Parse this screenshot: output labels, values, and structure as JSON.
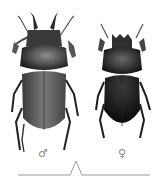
{
  "figure": {
    "specimens": [
      {
        "id": "male",
        "label": "♂",
        "sex": "male",
        "elytra_color": "#6e6e6e",
        "body_color": "#1c1c1c"
      },
      {
        "id": "female",
        "label": "♀",
        "sex": "female",
        "elytra_color": "#141414",
        "body_color": "#1a1a1a"
      }
    ],
    "background": "#ffffff"
  },
  "callout": {
    "shape": "caret-line",
    "color": "#9a9a9a"
  }
}
